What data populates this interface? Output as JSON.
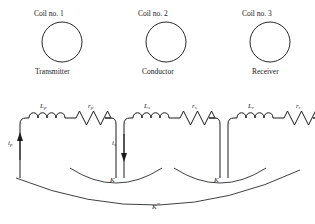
{
  "figure": {
    "coils": [
      {
        "title": "Coil no. 1",
        "role": "Transmitter"
      },
      {
        "title": "Coil no. 2",
        "role": "Conductor"
      },
      {
        "title": "Coil no. 3",
        "role": "Receiver"
      }
    ],
    "circuits": [
      {
        "inductor_symbol": "L",
        "inductor_subscript": "p",
        "resistor_symbol": "r",
        "resistor_subscript": "p",
        "current_symbol": "i",
        "current_subscript": "p",
        "current_direction": "up"
      },
      {
        "inductor_symbol": "L",
        "inductor_subscript": "s",
        "resistor_symbol": "r",
        "resistor_subscript": "s",
        "current_symbol": "i",
        "current_subscript": "s",
        "current_direction": "down"
      },
      {
        "inductor_symbol": "L",
        "inductor_subscript": "r",
        "resistor_symbol": "r",
        "resistor_subscript": "r",
        "current_symbol": "",
        "current_subscript": "",
        "current_direction": "none"
      }
    ],
    "couplings": [
      {
        "symbol": "K",
        "primes": ""
      },
      {
        "symbol": "K",
        "primes": "′"
      },
      {
        "symbol": "K",
        "primes": "′′′"
      }
    ],
    "colors": {
      "ink": "#1c1c1c",
      "background": "#ffffff"
    }
  }
}
